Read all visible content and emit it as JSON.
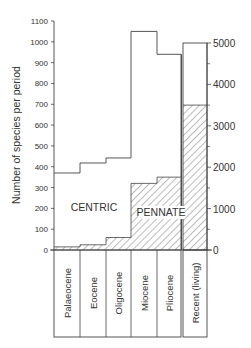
{
  "chart_data": {
    "type": "bar",
    "subtype": "stacked-step-histogram",
    "title": "",
    "ylabel": "Number of species per period",
    "xlabel": "",
    "categories": [
      "Palaeocene",
      "Eocene",
      "Oligocene",
      "Miocene",
      "Pliocene",
      "Recent (living)"
    ],
    "series": [
      {
        "name": "PENNATE",
        "hatched": true,
        "values": [
          15,
          25,
          60,
          320,
          350,
          3500
        ]
      },
      {
        "name": "CENTRIC",
        "hatched": false,
        "values": [
          355,
          393,
          382,
          730,
          590,
          1500
        ]
      }
    ],
    "totals": [
      370,
      418,
      442,
      1050,
      940,
      5000
    ],
    "left_axis": {
      "ylim": [
        0,
        1100
      ],
      "ticks": [
        0,
        100,
        200,
        300,
        400,
        500,
        600,
        700,
        800,
        900,
        1000,
        1100
      ],
      "applies_to": [
        "Palaeocene",
        "Eocene",
        "Oligocene",
        "Miocene",
        "Pliocene"
      ]
    },
    "right_axis": {
      "ylim": [
        0,
        5000
      ],
      "ticks": [
        0,
        1000,
        2000,
        3000,
        4000,
        5000
      ],
      "minor_ticks": [
        500,
        1500,
        2500,
        3500,
        4500
      ],
      "applies_to": [
        "Recent (living)"
      ]
    },
    "annotations": [
      "CENTRIC",
      "PENNATE"
    ],
    "grid": false,
    "legend": "none (in-plot labels)"
  },
  "labels": {
    "ylabel": "Number of species per period",
    "centric": "CENTRIC",
    "pennate": "PENNATE",
    "left_ticks": [
      "0",
      "100",
      "200",
      "300",
      "400",
      "500",
      "600",
      "700",
      "800",
      "900",
      "1000",
      "1100"
    ],
    "right_ticks": [
      "0",
      "1000",
      "2000",
      "3000",
      "4000",
      "5000"
    ],
    "categories": [
      "Palaeocene",
      "Eocene",
      "Oligocene",
      "Miocene",
      "Pliocene",
      "Recent (living)"
    ]
  },
  "colors": {
    "line": "#444444",
    "hatch": "#555555",
    "background": "#ffffff"
  }
}
